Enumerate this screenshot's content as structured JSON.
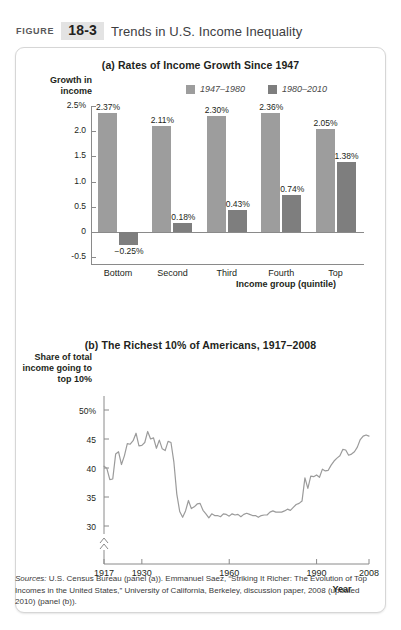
{
  "header": {
    "figure_word": "FIGURE",
    "figure_number": "18-3",
    "title": "Trends in U.S. Income Inequality"
  },
  "panel_a": {
    "title": "(a) Rates of Income Growth Since 1947",
    "y_axis_label": "Growth in income",
    "x_axis_label": "Income group (quintile)",
    "legend": [
      {
        "label": "1947–1980",
        "color": "#9d9d9d"
      },
      {
        "label": "1980–2010",
        "color": "#7e7e7e"
      }
    ]
  },
  "panel_b": {
    "title": "(b) The Richest 10% of Americans, 1917–2008",
    "y_axis_label": "Share of total income going to top 10%",
    "x_axis_label": "Year"
  },
  "sources": {
    "prefix": "Sources:",
    "text": " U.S. Census Bureau (panel (a)). Emmanuel Saez, “Striking It Richer: The Evolution of Top Incomes in the United States,” University of California, Berkeley, discussion paper, 2008 (updated 2010) (panel (b))."
  },
  "chart_data": [
    {
      "type": "bar",
      "title": "(a) Rates of Income Growth Since 1947",
      "xlabel": "Income group (quintile)",
      "ylabel": "Growth in income",
      "categories": [
        "Bottom",
        "Second",
        "Third",
        "Fourth",
        "Top"
      ],
      "ylim": [
        -0.5,
        2.75
      ],
      "yticks": [
        "2.5%",
        "2.0",
        "1.5",
        "1.0",
        "0.5",
        "0",
        "-0.5"
      ],
      "ytick_values": [
        2.5,
        2.0,
        1.5,
        1.0,
        0.5,
        0,
        -0.5
      ],
      "grid": false,
      "legend_position": "top-right",
      "series": [
        {
          "name": "1947–1980",
          "color": "#9d9d9d",
          "values": [
            2.37,
            2.11,
            2.3,
            2.36,
            2.05
          ],
          "labels": [
            "2.37%",
            "2.11%",
            "2.30%",
            "2.36%",
            "2.05%"
          ]
        },
        {
          "name": "1980–2010",
          "color": "#7e7e7e",
          "values": [
            -0.25,
            0.18,
            0.43,
            0.74,
            1.38
          ],
          "labels": [
            "−0.25%",
            "0.18%",
            "0.43%",
            "0.74%",
            "1.38%"
          ]
        }
      ]
    },
    {
      "type": "line",
      "title": "(b) The Richest 10% of Americans, 1917–2008",
      "xlabel": "Year",
      "ylabel": "Share of total income going to top 10%",
      "ylim": [
        28.5,
        51
      ],
      "yticks": [
        "50%",
        "45",
        "40",
        "35",
        "30"
      ],
      "ytick_values": [
        50,
        45,
        40,
        35,
        30
      ],
      "xlim": [
        1917,
        2008
      ],
      "xticks": [
        "1917",
        "1930",
        "1960",
        "1990",
        "2008"
      ],
      "xtick_values": [
        1917,
        1930,
        1960,
        1990,
        2008
      ],
      "axis_break": true,
      "grid": false,
      "line_color": "#9b9b9b",
      "series": [
        {
          "name": "Share of total income going to top 10%",
          "x": [
            1917,
            1918,
            1919,
            1920,
            1921,
            1922,
            1923,
            1924,
            1925,
            1926,
            1927,
            1928,
            1929,
            1930,
            1931,
            1932,
            1933,
            1934,
            1935,
            1936,
            1937,
            1938,
            1939,
            1940,
            1941,
            1942,
            1943,
            1944,
            1945,
            1946,
            1947,
            1948,
            1949,
            1950,
            1951,
            1952,
            1953,
            1954,
            1955,
            1956,
            1957,
            1958,
            1959,
            1960,
            1961,
            1962,
            1963,
            1964,
            1965,
            1966,
            1967,
            1968,
            1969,
            1970,
            1971,
            1972,
            1973,
            1974,
            1975,
            1976,
            1977,
            1978,
            1979,
            1980,
            1981,
            1982,
            1983,
            1984,
            1985,
            1986,
            1987,
            1988,
            1989,
            1990,
            1991,
            1992,
            1993,
            1994,
            1995,
            1996,
            1997,
            1998,
            1999,
            2000,
            2001,
            2002,
            2003,
            2004,
            2005,
            2006,
            2007,
            2008
          ],
          "values": [
            40.3,
            39.9,
            38.0,
            38.1,
            42.4,
            42.8,
            40.6,
            42.1,
            44.2,
            44.1,
            44.7,
            46.0,
            43.8,
            43.9,
            44.4,
            46.3,
            45.0,
            45.2,
            43.4,
            44.8,
            43.3,
            43.0,
            44.6,
            44.4,
            41.0,
            35.5,
            32.5,
            31.5,
            32.6,
            34.4,
            33.0,
            33.3,
            33.8,
            33.9,
            32.7,
            32.1,
            31.4,
            32.1,
            31.8,
            31.8,
            31.6,
            32.1,
            32.0,
            31.7,
            32.1,
            31.9,
            32.0,
            31.6,
            32.0,
            32.2,
            32.0,
            31.8,
            31.8,
            31.5,
            31.8,
            31.9,
            31.9,
            32.4,
            32.6,
            32.4,
            32.4,
            32.4,
            32.6,
            32.9,
            32.7,
            33.2,
            33.7,
            33.9,
            34.3,
            38.3,
            36.5,
            38.6,
            38.5,
            38.8,
            38.4,
            39.8,
            39.5,
            39.6,
            40.5,
            41.2,
            41.7,
            42.1,
            43.2,
            43.1,
            42.2,
            42.4,
            42.8,
            43.6,
            44.9,
            45.5,
            45.7,
            45.5
          ]
        }
      ]
    }
  ]
}
